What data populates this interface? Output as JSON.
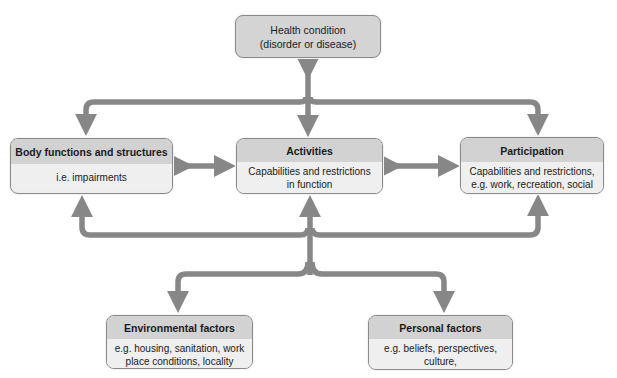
{
  "diagram": {
    "type": "ICF biopsychosocial model",
    "colors": {
      "arrow": "#878787",
      "header_fill": "#d2d2d2",
      "body_fill": "#efefef",
      "border": "#8a8a8a"
    },
    "health_condition": {
      "line1": "Health condition",
      "line2": "(disorder or disease)"
    },
    "body_functions": {
      "title": "Body functions and structures",
      "text": "i.e. impairments"
    },
    "activities": {
      "title": "Activities",
      "line1": "Capabilities and restrictions",
      "line2": "in function"
    },
    "participation": {
      "title": "Participation",
      "line1": "Capabilities and restrictions,",
      "line2": "e.g. work, recreation, social"
    },
    "environmental": {
      "title": "Environmental factors",
      "line1": "e.g. housing, sanitation, work",
      "line2": "place conditions, locality"
    },
    "personal": {
      "title": "Personal factors",
      "line1": "e.g. beliefs, perspectives, culture,",
      "line2": "socio-economic status, education"
    },
    "connections": [
      {
        "from": "Health condition",
        "to": "Activities",
        "direction": "bidirectional"
      },
      {
        "from": "Health condition",
        "to": "Body functions and structures",
        "direction": "one-way"
      },
      {
        "from": "Health condition",
        "to": "Participation",
        "direction": "one-way"
      },
      {
        "from": "Body functions and structures",
        "to": "Activities",
        "direction": "bidirectional"
      },
      {
        "from": "Activities",
        "to": "Participation",
        "direction": "bidirectional"
      },
      {
        "from": "Contextual hub",
        "to": "Body functions and structures",
        "direction": "one-way"
      },
      {
        "from": "Contextual hub",
        "to": "Activities",
        "direction": "one-way"
      },
      {
        "from": "Contextual hub",
        "to": "Participation",
        "direction": "one-way"
      },
      {
        "from": "Contextual hub",
        "to": "Environmental factors",
        "direction": "one-way"
      },
      {
        "from": "Contextual hub",
        "to": "Personal factors",
        "direction": "one-way"
      }
    ]
  }
}
